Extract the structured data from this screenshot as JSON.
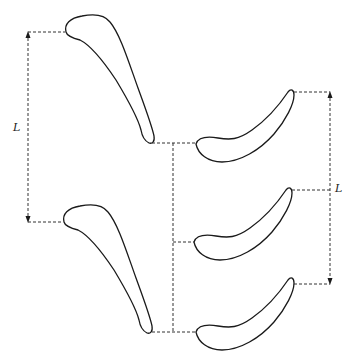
{
  "diagram": {
    "type": "turbine blade cascade (stator / rotor rows)",
    "labels": {
      "left_pitch": "L",
      "right_pitch": "L"
    },
    "left_row": {
      "blade_count": 2,
      "pitch_label": "L"
    },
    "right_row": {
      "blade_count": 3,
      "pitch_label": "L"
    },
    "colors": {
      "stroke": "#1a1a1a",
      "background": "#ffffff"
    }
  }
}
